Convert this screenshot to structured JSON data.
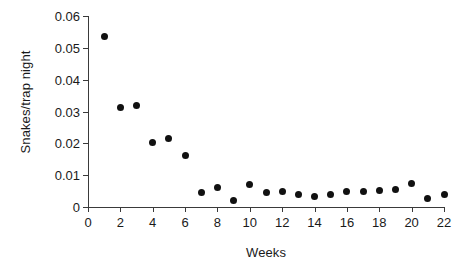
{
  "chart_data": {
    "type": "scatter",
    "title": "",
    "subtitle": "",
    "xlabel": "Weeks",
    "ylabel": "Snakes/trap night",
    "xlim": [
      0,
      22
    ],
    "ylim": [
      0,
      0.06
    ],
    "grid": false,
    "legend": null,
    "marker": {
      "shape": "circle",
      "color": "#111111",
      "filled": true
    },
    "xticks": [
      0,
      2,
      4,
      6,
      8,
      10,
      12,
      14,
      16,
      18,
      20,
      22
    ],
    "xticklabels": [
      "0",
      "2",
      "4",
      "6",
      "8",
      "10",
      "12",
      "14",
      "16",
      "18",
      "20",
      "22"
    ],
    "yticks": [
      0,
      0.01,
      0.02,
      0.03,
      0.04,
      0.05,
      0.06
    ],
    "yticklabels": [
      "0",
      "0.01",
      "0.02",
      "0.03",
      "0.04",
      "0.05",
      "0.06"
    ],
    "x": [
      1,
      2,
      3,
      4,
      5,
      6,
      7,
      8,
      9,
      10,
      11,
      12,
      13,
      14,
      15,
      16,
      17,
      18,
      19,
      20,
      21,
      22
    ],
    "y": [
      0.0535,
      0.0312,
      0.0319,
      0.0204,
      0.0215,
      0.0163,
      0.0045,
      0.0061,
      0.0019,
      0.007,
      0.0045,
      0.0048,
      0.004,
      0.0034,
      0.0039,
      0.005,
      0.005,
      0.0053,
      0.0056,
      0.0075,
      0.0028,
      0.0039
    ],
    "points": [
      {
        "week": 1,
        "value": 0.0535
      },
      {
        "week": 2,
        "value": 0.0312
      },
      {
        "week": 3,
        "value": 0.0319
      },
      {
        "week": 4,
        "value": 0.0204
      },
      {
        "week": 5,
        "value": 0.0215
      },
      {
        "week": 6,
        "value": 0.0163
      },
      {
        "week": 7,
        "value": 0.0045
      },
      {
        "week": 8,
        "value": 0.0061
      },
      {
        "week": 9,
        "value": 0.0019
      },
      {
        "week": 10,
        "value": 0.007
      },
      {
        "week": 11,
        "value": 0.0045
      },
      {
        "week": 12,
        "value": 0.0048
      },
      {
        "week": 13,
        "value": 0.004
      },
      {
        "week": 14,
        "value": 0.0034
      },
      {
        "week": 15,
        "value": 0.0039
      },
      {
        "week": 16,
        "value": 0.005
      },
      {
        "week": 17,
        "value": 0.005
      },
      {
        "week": 18,
        "value": 0.0053
      },
      {
        "week": 19,
        "value": 0.0056
      },
      {
        "week": 20,
        "value": 0.0075
      },
      {
        "week": 21,
        "value": 0.0028
      },
      {
        "week": 22,
        "value": 0.0039
      }
    ]
  },
  "colors": {
    "background": "#ffffff",
    "axis": "#3a3a3a",
    "text": "#1a1a1a",
    "marker": "#111111"
  }
}
